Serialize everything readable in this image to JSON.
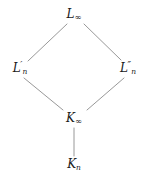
{
  "diagram": {
    "type": "lattice-diagram",
    "title": "",
    "width": 145,
    "height": 178,
    "background_color": "#ffffff",
    "edge_color": "#8c8c8c",
    "text_color": "#1a1a1a",
    "nodes": [
      {
        "id": "L_infinity",
        "label": "L∞",
        "base": "L",
        "subscript": "∞",
        "prime": "",
        "x": 74,
        "y": 15
      },
      {
        "id": "L_prime_n",
        "label": "L′n",
        "base": "L",
        "subscript": "n",
        "prime": "′",
        "x": 20,
        "y": 68
      },
      {
        "id": "L_doubleprime_n",
        "label": "L″n",
        "base": "L",
        "subscript": "n",
        "prime": "″",
        "x": 128,
        "y": 68
      },
      {
        "id": "K_infinity",
        "label": "K∞",
        "base": "K",
        "subscript": "∞",
        "prime": "",
        "x": 74,
        "y": 119
      },
      {
        "id": "K_n",
        "label": "Kn",
        "base": "K",
        "subscript": "n",
        "prime": "",
        "x": 74,
        "y": 165
      }
    ],
    "edges": [
      {
        "id": "edge-Lprime-n-to-L-infinity",
        "from": "L_prime_n",
        "to": "L_infinity",
        "x1": 28,
        "y1": 61,
        "x2": 67,
        "y2": 24
      },
      {
        "id": "edge-L-infinity-to-Ldoubleprime-n",
        "from": "L_infinity",
        "to": "L_doubleprime_n",
        "x1": 84,
        "y1": 24,
        "x2": 121,
        "y2": 60
      },
      {
        "id": "edge-K-infinity-to-Lprime-n",
        "from": "K_infinity",
        "to": "L_prime_n",
        "x1": 24,
        "y1": 78,
        "x2": 63,
        "y2": 110
      },
      {
        "id": "edge-Ldoubleprime-n-to-K-infinity",
        "from": "L_doubleprime_n",
        "to": "K_infinity",
        "x1": 87,
        "y1": 110,
        "x2": 124,
        "y2": 78
      },
      {
        "id": "edge-K-n-to-K-infinity",
        "from": "K_n",
        "to": "K_infinity",
        "x1": 74,
        "y1": 128,
        "x2": 74,
        "y2": 156
      }
    ]
  }
}
